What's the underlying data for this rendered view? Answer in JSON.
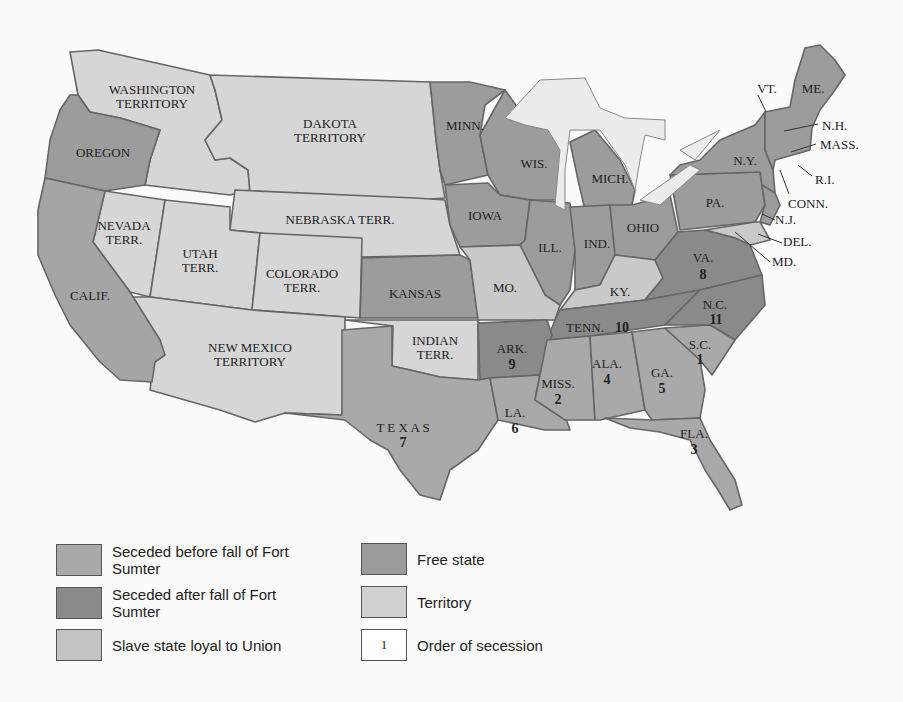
{
  "colors": {
    "seceded_before": "#a9a9a9",
    "seceded_after": "#8a8a8a",
    "slave_loyal": "#c9c9c9",
    "free_state": "#9c9c9c",
    "territory": "#d6d6d6",
    "water": "#ececec",
    "border": "#666666"
  },
  "map": {
    "labels": {
      "washington": [
        "WASHINGTON",
        "TERRITORY"
      ],
      "oregon": "OREGON",
      "dakota": [
        "DAKOTA",
        "TERRITORY"
      ],
      "nebraska": "NEBRASKA TERR.",
      "nevada": [
        "NEVADA",
        "TERR."
      ],
      "utah": [
        "UTAH",
        "TERR."
      ],
      "colorado": [
        "COLORADO",
        "TERR."
      ],
      "calif": "CALIF.",
      "kansas": "KANSAS",
      "new_mexico": [
        "NEW MEXICO",
        "TERRITORY"
      ],
      "indian": [
        "INDIAN",
        "TERR."
      ],
      "texas": "T E X A S",
      "minn": "MINN.",
      "iowa": "IOWA",
      "wis": "WIS.",
      "mich": "MICH.",
      "ill": "ILL.",
      "ind": "IND.",
      "ohio": "OHIO",
      "mo": "MO.",
      "ky": "KY.",
      "pa": "PA.",
      "ny": "N.Y.",
      "vt": "VT.",
      "me": "ME.",
      "nh": "N.H.",
      "mass": "MASS.",
      "ri": "R.I.",
      "conn": "CONN.",
      "nj": "N.J.",
      "del": "DEL.",
      "md": "MD.",
      "va": "VA.",
      "nc": "N.C.",
      "tenn": "TENN.",
      "ark": "ARK.",
      "sc": "S.C.",
      "ga": "GA.",
      "ala": "ALA.",
      "miss": "MISS.",
      "la": "LA.",
      "fla": "FLA."
    },
    "secession_order": {
      "sc": "1",
      "miss": "2",
      "fla": "3",
      "ala": "4",
      "ga": "5",
      "la": "6",
      "texas": "7",
      "va": "8",
      "ark": "9",
      "tenn": "10",
      "nc": "11"
    }
  },
  "legend": [
    {
      "key": "seceded_before",
      "label": "Seceded before fall of Fort Sumter"
    },
    {
      "key": "seceded_after",
      "label": "Seceded after fall of Fort Sumter"
    },
    {
      "key": "slave_loyal",
      "label": "Slave state loyal to Union"
    },
    {
      "key": "free_state",
      "label": "Free state"
    },
    {
      "key": "territory",
      "label": "Territory"
    },
    {
      "key": "order",
      "label": "Order of secession",
      "swatch_text": "1"
    }
  ]
}
